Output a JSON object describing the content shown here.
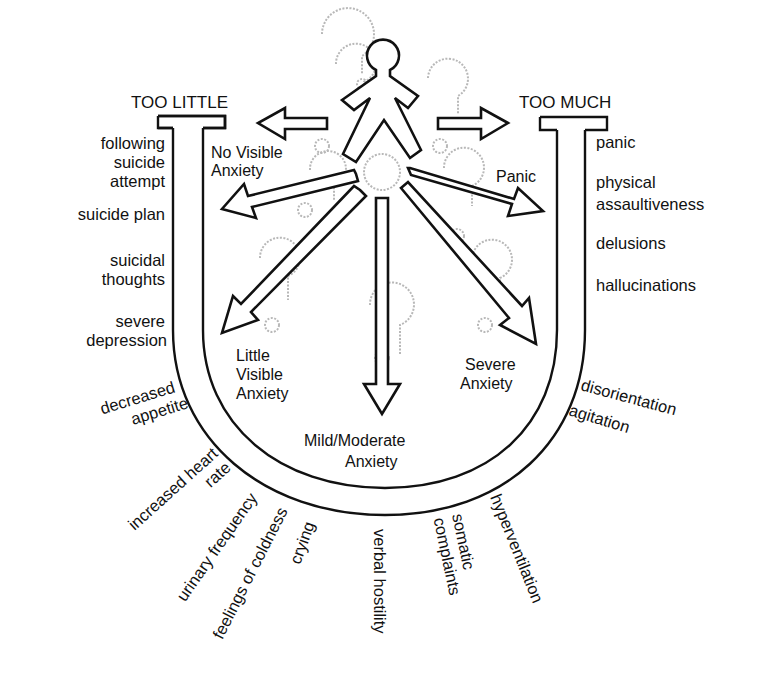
{
  "diagram": {
    "title_left": "TOO LITTLE",
    "title_right": "TOO MUCH",
    "inner_labels": {
      "no_visible": [
        "No Visible",
        "Anxiety"
      ],
      "little_visible": [
        "Little",
        "Visible",
        "Anxiety"
      ],
      "mild_moderate": [
        "Mild/Moderate",
        "Anxiety"
      ],
      "severe": [
        "Severe",
        "Anxiety"
      ],
      "panic": "Panic"
    },
    "left_symptoms": [
      [
        "following",
        "suicide",
        "attempt"
      ],
      [
        "suicide plan"
      ],
      [
        "suicidal",
        "thoughts"
      ],
      [
        "severe",
        "depression"
      ],
      [
        "decreased",
        "appetite"
      ]
    ],
    "right_symptoms": [
      [
        "panic"
      ],
      [
        "physical",
        "assaultiveness"
      ],
      [
        "delusions"
      ],
      [
        "hallucinations"
      ],
      [
        "disorientation"
      ],
      [
        "agitation"
      ]
    ],
    "bottom_symptoms": [
      [
        "increased heart",
        "rate"
      ],
      [
        "urinary frequency"
      ],
      [
        "feelings of coldness"
      ],
      [
        "crying"
      ],
      [
        "verbal hostility"
      ],
      [
        "somatic",
        "complaints"
      ],
      [
        "hyperventilation"
      ]
    ],
    "colors": {
      "ink": "#111111",
      "question_marks": "#b8b8b8",
      "background": "#ffffff"
    }
  }
}
